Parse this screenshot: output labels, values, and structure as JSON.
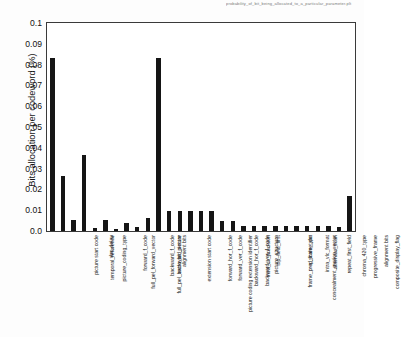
{
  "figure": {
    "title": "probability_of_bit_being_allocated_to_a_particular_parameter.plt",
    "ylabel": "Bits allocation per codeword (%)",
    "bar_color": "#151515",
    "frame_color": "#3a3a3a"
  },
  "chart_data": {
    "type": "bar",
    "title": "probability_of_bit_being_allocated_to_a_particular_parameter.plt",
    "xlabel": "",
    "ylabel": "Bits allocation per codeword (%)",
    "ylim": [
      0,
      0.1
    ],
    "ytick_labels": [
      "0.1",
      "0.09",
      "0.08",
      "0.07",
      "0.06",
      "0.05",
      "0.04",
      "0.03",
      "0.02",
      "0.01",
      "0.0"
    ],
    "ytick_values": [
      0.1,
      0.09,
      0.08,
      0.07,
      0.06,
      0.05,
      0.04,
      0.03,
      0.02,
      0.01,
      0.0
    ],
    "grid": false,
    "legend": "none",
    "categories": [
      "picture start code",
      "temporal_reference",
      "picture_coding_type",
      "vbv_delay",
      "full_pel_forward_vector",
      "forward_f_code",
      "full_pel_backward_vector",
      "backward_f_code",
      "extra_bit_picture",
      "alignment bits",
      "extension start code",
      "picture coding extension identifier",
      "forward_hor_f_code",
      "forward_ver_f_code",
      "backward_hor_f_code",
      "backward_ver_f_code",
      "intra_dc_precision",
      "picture_structure",
      "top_field_first",
      "frame_pred_frame_dct",
      "concealment_motion_vector",
      "q_scale_type",
      "intra_vlc_format",
      "alternate_scan",
      "repeat_first_field",
      "chroma_420_type",
      "progressive_frame",
      "composite_display_flag",
      "alignment bits"
    ],
    "values": [
      0.0833,
      0.0265,
      0.0052,
      0.0367,
      0.0013,
      0.0055,
      0.001,
      0.004,
      0.002,
      0.0063,
      0.0833,
      0.0095,
      0.0095,
      0.0095,
      0.0095,
      0.0095,
      0.005,
      0.005,
      0.0022,
      0.0022,
      0.0022,
      0.0022,
      0.0022,
      0.0022,
      0.0022,
      0.0022,
      0.0022,
      0.0018,
      0.0168
    ]
  }
}
